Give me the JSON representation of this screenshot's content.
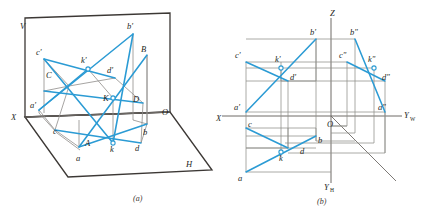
{
  "figure": {
    "title": "",
    "captions": [
      {
        "id": "caption-a",
        "text": "(a)",
        "x": 138,
        "y": 200
      },
      {
        "id": "caption-b",
        "text": "(b)",
        "x": 321,
        "y": 203
      }
    ],
    "colors": {
      "line_blue": "#2b9bd4",
      "line_dark": "#3c3835",
      "line_gray": "#8a8a8a",
      "text": "#241f1c",
      "background": "#ffffff"
    },
    "stroke_widths": {
      "blue": 1.5,
      "dark": 1.3,
      "gray": 0.8,
      "thin": 0.6
    }
  },
  "pictorial": {
    "name": "3D pictorial view with V and H projection planes",
    "plane_labels": [
      {
        "id": "plane-V",
        "text": "V",
        "x": 20,
        "y": 29
      },
      {
        "id": "plane-H",
        "text": "H",
        "x": 186,
        "y": 167
      },
      {
        "id": "axis-X",
        "text": "X",
        "x": 11,
        "y": 120
      },
      {
        "id": "origin-O",
        "text": "O",
        "x": 162,
        "y": 115
      }
    ],
    "v_plane_outline": "25,18 170,13 170,112 25,117",
    "h_plane_outline": "25,117 170,112 212,170 68,177",
    "x_axis": "25,117 170,112",
    "points": [
      {
        "id": "a-prime",
        "label": "a'",
        "x": 39,
        "y": 110,
        "lx": 30,
        "ly": 108
      },
      {
        "id": "b-prime",
        "label": "b'",
        "x": 133,
        "y": 34,
        "lx": 127,
        "ly": 29
      },
      {
        "id": "c-prime",
        "label": "c'",
        "x": 44,
        "y": 59,
        "lx": 36,
        "ly": 55
      },
      {
        "id": "d-prime",
        "label": "d'",
        "x": 115,
        "y": 78,
        "lx": 107,
        "ly": 73
      },
      {
        "id": "k-prime",
        "label": "k'",
        "x": 88,
        "y": 69,
        "lx": 83,
        "ly": 62
      },
      {
        "id": "A",
        "label": "A",
        "x": 79,
        "y": 147,
        "lx": 86,
        "ly": 145
      },
      {
        "id": "B",
        "label": "B",
        "x": 147,
        "y": 55,
        "lx": 141,
        "ly": 51
      },
      {
        "id": "C",
        "label": "C",
        "x": 44,
        "y": 91,
        "lx": 47,
        "ly": 77
      },
      {
        "id": "D",
        "label": "D",
        "x": 143,
        "y": 103,
        "lx": 133,
        "ly": 101
      },
      {
        "id": "K",
        "label": "K",
        "x": 113,
        "y": 98,
        "lx": 104,
        "ly": 100
      },
      {
        "id": "a",
        "label": "a",
        "x": 79,
        "y": 147,
        "lx": 76,
        "ly": 160
      },
      {
        "id": "b",
        "label": "b",
        "x": 147,
        "y": 124,
        "lx": 143,
        "ly": 134
      },
      {
        "id": "c",
        "label": "c",
        "x": 55,
        "y": 130,
        "lx": 54,
        "ly": 133
      },
      {
        "id": "d",
        "label": "d",
        "x": 141,
        "y": 143,
        "lx": 135,
        "ly": 150
      },
      {
        "id": "k",
        "label": "k",
        "x": 113,
        "y": 143,
        "lx": 111,
        "ly": 151
      }
    ],
    "blue_segments": [
      {
        "id": "seg-a-prime-b-prime",
        "from": "a-prime",
        "to": "b-prime"
      },
      {
        "id": "seg-c-prime-d-prime",
        "from": "c-prime",
        "to": "d-prime"
      },
      {
        "id": "seg-A-B",
        "from": "A",
        "to": "B"
      },
      {
        "id": "seg-C-D",
        "from": "C",
        "to": "D"
      },
      {
        "id": "seg-a-b",
        "from": "a",
        "to": "b"
      },
      {
        "id": "seg-c-d",
        "from": "c",
        "to": "d"
      },
      {
        "id": "seg-c-prime-K",
        "from": "c-prime",
        "to": "K"
      },
      {
        "id": "seg-b-prime-K",
        "from": "b-prime",
        "to": "K"
      },
      {
        "id": "seg-a-prime-k-prime",
        "from": "a-prime",
        "to": "k-prime"
      }
    ]
  },
  "orthographic": {
    "name": "Three-view orthographic projection drawing",
    "axis_labels": [
      {
        "id": "axis-Z",
        "text": "Z",
        "x": 333,
        "y": 16
      },
      {
        "id": "axis-X",
        "text": "X",
        "x": 219,
        "y": 121
      },
      {
        "id": "axis-YW",
        "text": "Y",
        "sub": "W",
        "x": 405,
        "y": 118
      },
      {
        "id": "axis-YH",
        "text": "Y",
        "sub": "H",
        "x": 327,
        "y": 189
      },
      {
        "id": "origin-O",
        "text": "O",
        "x": 330,
        "y": 126
      }
    ],
    "axes": {
      "vertical": "331,18 331,183",
      "horizontal": "222,116 402,116",
      "bisector": "331,116 395,180"
    },
    "points": [
      {
        "id": "a-prime",
        "label": "a'",
        "x": 246,
        "y": 112,
        "lx": 236,
        "ly": 109
      },
      {
        "id": "b-prime",
        "label": "b'",
        "x": 316,
        "y": 39,
        "lx": 311,
        "ly": 34
      },
      {
        "id": "c-prime",
        "label": "c'",
        "x": 246,
        "y": 62,
        "lx": 237,
        "ly": 58
      },
      {
        "id": "d-prime",
        "label": "d'",
        "x": 288,
        "y": 81,
        "lx": 291,
        "ly": 81
      },
      {
        "id": "k-prime",
        "label": "k'",
        "x": 281,
        "y": 68,
        "lx": 276,
        "ly": 61
      },
      {
        "id": "a",
        "label": "a",
        "x": 246,
        "y": 172,
        "lx": 240,
        "ly": 180
      },
      {
        "id": "b",
        "label": "b",
        "x": 316,
        "y": 136,
        "lx": 319,
        "ly": 143
      },
      {
        "id": "c",
        "label": "c",
        "x": 246,
        "y": 128,
        "lx": 248,
        "ly": 127
      },
      {
        "id": "d",
        "label": "d",
        "x": 288,
        "y": 148,
        "lx": 302,
        "ly": 154
      },
      {
        "id": "k",
        "label": "k",
        "x": 281,
        "y": 152,
        "lx": 282,
        "ly": 160
      },
      {
        "id": "a-double-prime",
        "label": "a\"",
        "x": 385,
        "y": 112,
        "lx": 380,
        "ly": 109
      },
      {
        "id": "b-double-prime",
        "label": "b\"",
        "x": 355,
        "y": 39,
        "lx": 352,
        "ly": 34
      },
      {
        "id": "c-double-prime",
        "label": "c\"",
        "x": 347,
        "y": 62,
        "lx": 341,
        "ly": 58
      },
      {
        "id": "d-double-prime",
        "label": "d\"",
        "x": 382,
        "y": 81,
        "lx": 383,
        "ly": 80
      },
      {
        "id": "k-double-prime",
        "label": "k\"",
        "x": 374,
        "y": 68,
        "lx": 370,
        "ly": 61
      }
    ],
    "blue_segments": [
      {
        "id": "seg-a-prime-b-prime",
        "from": "a-prime",
        "to": "b-prime"
      },
      {
        "id": "seg-c-prime-d-prime",
        "from": "c-prime",
        "to": "d-prime"
      },
      {
        "id": "seg-a-b",
        "from": "a",
        "to": "b"
      },
      {
        "id": "seg-c-d",
        "from": "c",
        "to": "d"
      },
      {
        "id": "seg-a2-b2",
        "from": "a-double-prime",
        "to": "b-double-prime"
      },
      {
        "id": "seg-c2-d2",
        "from": "c-double-prime",
        "to": "d-double-prime"
      }
    ]
  }
}
